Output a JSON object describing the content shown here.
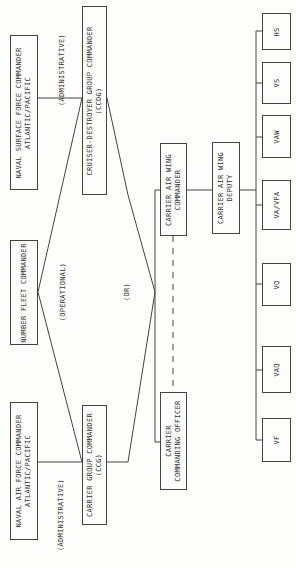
{
  "boxes": {
    "surface_force": "NAVAL SURFACE FORCE COMMANDER\nATLANTIC/PACIFIC",
    "cruiser_destroyer": "CRUISER-DESTROYER GROUP COMMANDER\n(CCDG)",
    "number_fleet": "NUMBER FLEET COMMANDER",
    "air_force": "NAVAL AIR FORCE COMMANDER\nATLANTIC/PACIFIC",
    "carrier_group": "CARRIER GROUP COMMANDER\n(CCG)",
    "air_wing_commander": "CARRIER AIR WING\nCOMMANDER",
    "air_wing_deputy": "CARRIER AIR WING\nDEPUTY",
    "carrier_co": "CARRIER\nCOMMANDING OFFICER"
  },
  "squadrons": [
    "HS",
    "VS",
    "VAW",
    "VA/VFA",
    "VQ",
    "VAQ",
    "VF"
  ],
  "notes": {
    "admin_top": "(ADMINISTRATIVE)",
    "operational": "(OPERATIONAL)",
    "or": "(OR)",
    "admin_bottom": "(ADMINISTRATIVE)"
  }
}
